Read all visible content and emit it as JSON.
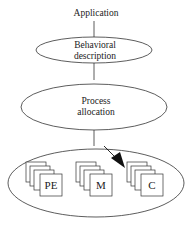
{
  "diagram": {
    "top_label": "Application",
    "nodes": [
      {
        "id": "behavioral",
        "line1": "Behavioral",
        "line2": "description"
      },
      {
        "id": "process",
        "line1": "Process",
        "line2": "allocation"
      }
    ],
    "container": {
      "stacks": [
        {
          "label": "PE"
        },
        {
          "label": "M"
        },
        {
          "label": "C"
        }
      ]
    },
    "arrow": {
      "from": "process-allocation",
      "to": "C-stack"
    },
    "colors": {
      "stroke": "#333333",
      "fill": "#ffffff",
      "arrow": "#111111"
    }
  }
}
